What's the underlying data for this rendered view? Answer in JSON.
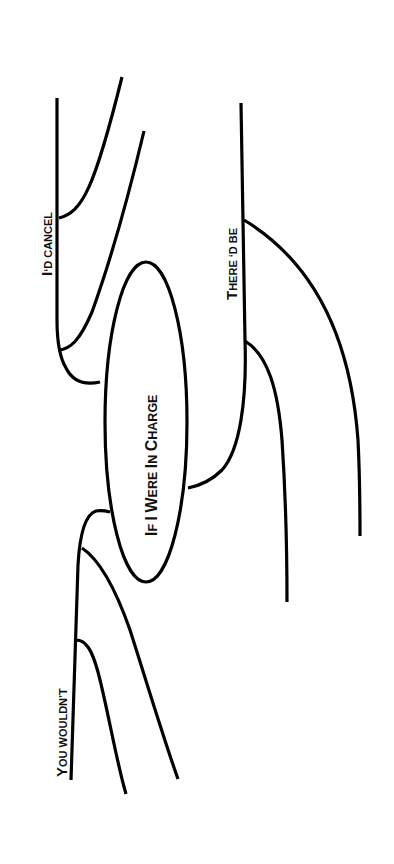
{
  "diagram": {
    "type": "sentence-diagram",
    "orientation": "rotated-90-ccw",
    "colors": {
      "background": "#ffffff",
      "ink": "#000000"
    },
    "center": {
      "text_parts": [
        {
          "cap": "I",
          "rest": "F "
        },
        {
          "cap": "I",
          "rest": " "
        },
        {
          "cap": "W",
          "rest": "ERE "
        },
        {
          "cap": "I",
          "rest": "N "
        },
        {
          "cap": "C",
          "rest": "HARGE"
        }
      ],
      "text": "If I Were In Charge"
    },
    "clauses": [
      {
        "id": "top",
        "cap": "I",
        "rest": "‘D CANCEL",
        "text": "I‘D CANCEL"
      },
      {
        "id": "right",
        "cap": "T",
        "rest": "HERE ‘D BE",
        "text": "THERE ‘D BE"
      },
      {
        "id": "bottom",
        "cap": "Y",
        "rest": "OU WOULDN’T",
        "text": "YOU WOULDN’T"
      }
    ]
  }
}
